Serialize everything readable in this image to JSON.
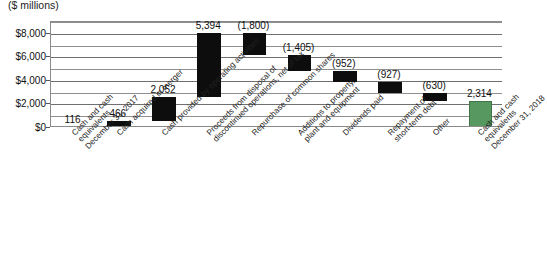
{
  "header": {
    "title_cut": "Cash flow summary",
    "subtitle": "($ millions)"
  },
  "chart_data": {
    "type": "bar",
    "subtype": "waterfall",
    "title": "($ millions)",
    "xlabel": "",
    "ylabel": "",
    "ylim": [
      0,
      9000
    ],
    "grid": true,
    "legend": false,
    "yticks": [
      "$0",
      "$2,000",
      "$4,000",
      "$6,000",
      "$8,000"
    ],
    "ytick_values": [
      0,
      2000,
      4000,
      6000,
      8000
    ],
    "minor_gridline_values": [
      1000,
      3000,
      5000,
      7000,
      9000
    ],
    "categories": [
      "Cash and cash\nequivalents\nDecember 31, 2017",
      "Cash acquired in merger",
      "Cash provided by operating activities",
      "Proceeds from disposal of\ndiscontinued operations, net of tax",
      "Repurchase of common shares",
      "Additions to property,\nplant and equipment",
      "Dividends paid",
      "Repayment of\nshort-term debt",
      "Other",
      "Cash and cash\nequivalents\nDecember 31, 2018"
    ],
    "labels": [
      "116",
      "466",
      "2,052",
      "5,394",
      "(1,800)",
      "(1,405)",
      "(952)",
      "(927)",
      "(630)",
      "2,314"
    ],
    "values": [
      116,
      466,
      2052,
      5394,
      -1800,
      -1405,
      -952,
      -927,
      -630,
      2314
    ],
    "kinds": [
      "total",
      "delta",
      "delta",
      "delta",
      "delta",
      "delta",
      "delta",
      "delta",
      "delta",
      "total"
    ],
    "cumulative_start": [
      0,
      116,
      582,
      2634,
      8028,
      6228,
      4823,
      3871,
      2944,
      0
    ],
    "cumulative_end": [
      116,
      582,
      2634,
      8028,
      6228,
      4823,
      3871,
      2944,
      2314,
      2314
    ],
    "colors": {
      "delta": "#0d0d0d",
      "total": "#56985f",
      "grid": "#8f8f8f",
      "axis": "#8a8a8a",
      "text": "#111111"
    }
  }
}
